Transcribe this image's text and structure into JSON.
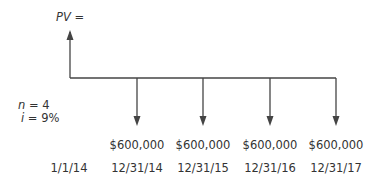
{
  "pv_label": {
    "var": "PV",
    "eq": " ="
  },
  "params": {
    "n": {
      "var": "n",
      "value": " = 4"
    },
    "i": {
      "var": "i",
      "value": " = 9%"
    }
  },
  "start_date": "1/1/14",
  "payments": [
    {
      "amount": "$600,000",
      "date": "12/31/14"
    },
    {
      "amount": "$600,000",
      "date": "12/31/15"
    },
    {
      "amount": "$600,000",
      "date": "12/31/16"
    },
    {
      "amount": "$600,000",
      "date": "12/31/17"
    }
  ],
  "line_color": "#444444"
}
